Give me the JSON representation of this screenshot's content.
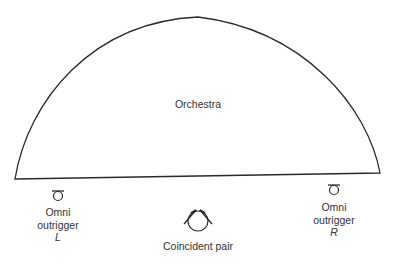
{
  "diagram": {
    "stage": {
      "label": "Orchestra",
      "shape": "semicircle"
    },
    "microphones": [
      {
        "name": "omni-outrigger-left",
        "type": "omni",
        "lines": [
          "Omni",
          "outrigger",
          "L"
        ]
      },
      {
        "name": "coincident-pair",
        "type": "coincident-pair",
        "lines": [
          "Coincident pair"
        ]
      },
      {
        "name": "omni-outrigger-right",
        "type": "omni",
        "lines": [
          "Omni",
          "outrigger",
          "R"
        ]
      }
    ],
    "colors": {
      "line": "#2a2a2a",
      "background": "#ffffff"
    }
  }
}
